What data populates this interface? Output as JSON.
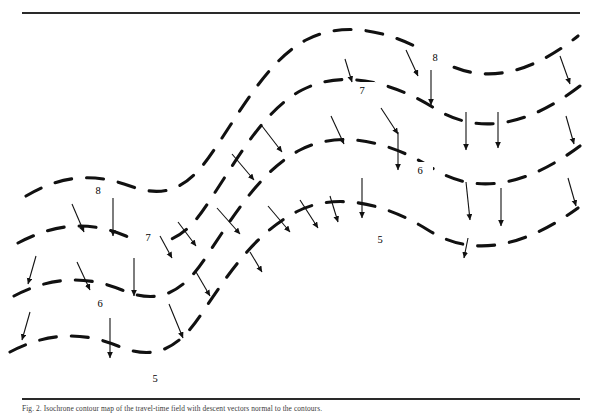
{
  "figure": {
    "kind": "contour-map",
    "background": "#ffffff",
    "ink_color": "#111111",
    "rule_color": "#2a2a2a",
    "top_rule": true,
    "bottom_rule": true
  },
  "caption": {
    "text": "Fig. 2. Isochrone contour map of the travel-time field with descent vectors normal to the contours."
  },
  "chart_data": {
    "type": "contour",
    "title": "",
    "xlabel": "",
    "ylabel": "",
    "grid": false,
    "legend": false,
    "line_style": "dashed",
    "line_color": "#111111",
    "levels": [
      8,
      7,
      6,
      5
    ],
    "level_label_text": [
      "8",
      "7",
      "6",
      "5"
    ],
    "arrows_meaning": "gradient-descent direction normal to contours",
    "arrow_count": 33,
    "contours": [
      {
        "level": 8,
        "label": "8",
        "labels_at": [
          [
            98,
            190
          ],
          [
            435,
            57
          ]
        ],
        "path": "M 26,196 C 60,176 92,172 130,186 C 168,200 190,186 214,150 C 240,112 268,60 306,40 C 348,18 398,34 436,58 C 474,82 520,82 578,36"
      },
      {
        "level": 7,
        "label": "7",
        "labels_at": [
          [
            148,
            237
          ],
          [
            362,
            90
          ]
        ],
        "path": "M 18,243 C 54,224 88,220 126,236 C 164,252 186,238 210,200 C 238,158 264,110 302,90 C 344,68 396,84 434,108 C 472,132 520,132 580,86"
      },
      {
        "level": 6,
        "label": "6",
        "labels_at": [
          [
            100,
            303
          ],
          [
            420,
            170
          ]
        ],
        "path": "M 14,296 C 48,278 84,274 122,290 C 160,306 184,292 208,254 C 236,212 262,170 300,150 C 342,128 394,144 432,168 C 470,192 518,192 580,146"
      },
      {
        "level": 5,
        "label": "5",
        "labels_at": [
          [
            155,
            378
          ],
          [
            380,
            239
          ]
        ],
        "path": "M 10,352 C 44,334 80,330 118,346 C 156,362 180,348 204,310 C 232,268 258,232 296,212 C 338,190 390,206 428,230 C 466,254 514,254 578,208"
      }
    ],
    "arrows": [
      {
        "x1": 72,
        "y1": 204,
        "x2": 84,
        "y2": 232
      },
      {
        "x1": 113,
        "y1": 198,
        "x2": 113,
        "y2": 236
      },
      {
        "x1": 36,
        "y1": 256,
        "x2": 28,
        "y2": 284
      },
      {
        "x1": 77,
        "y1": 262,
        "x2": 90,
        "y2": 290
      },
      {
        "x1": 134,
        "y1": 258,
        "x2": 134,
        "y2": 296
      },
      {
        "x1": 30,
        "y1": 312,
        "x2": 22,
        "y2": 340
      },
      {
        "x1": 110,
        "y1": 318,
        "x2": 110,
        "y2": 358
      },
      {
        "x1": 169,
        "y1": 304,
        "x2": 183,
        "y2": 338
      },
      {
        "x1": 178,
        "y1": 222,
        "x2": 196,
        "y2": 246
      },
      {
        "x1": 217,
        "y1": 208,
        "x2": 240,
        "y2": 234
      },
      {
        "x1": 232,
        "y1": 154,
        "x2": 254,
        "y2": 180
      },
      {
        "x1": 262,
        "y1": 126,
        "x2": 282,
        "y2": 152
      },
      {
        "x1": 268,
        "y1": 206,
        "x2": 290,
        "y2": 232
      },
      {
        "x1": 300,
        "y1": 200,
        "x2": 318,
        "y2": 228
      },
      {
        "x1": 331,
        "y1": 116,
        "x2": 344,
        "y2": 144
      },
      {
        "x1": 345,
        "y1": 59,
        "x2": 352,
        "y2": 82
      },
      {
        "x1": 362,
        "y1": 178,
        "x2": 362,
        "y2": 218
      },
      {
        "x1": 381,
        "y1": 108,
        "x2": 398,
        "y2": 134
      },
      {
        "x1": 398,
        "y1": 132,
        "x2": 398,
        "y2": 170
      },
      {
        "x1": 406,
        "y1": 50,
        "x2": 418,
        "y2": 76
      },
      {
        "x1": 431,
        "y1": 70,
        "x2": 431,
        "y2": 105
      },
      {
        "x1": 466,
        "y1": 112,
        "x2": 466,
        "y2": 150
      },
      {
        "x1": 466,
        "y1": 182,
        "x2": 470,
        "y2": 220
      },
      {
        "x1": 498,
        "y1": 112,
        "x2": 498,
        "y2": 148
      },
      {
        "x1": 501,
        "y1": 188,
        "x2": 501,
        "y2": 226
      },
      {
        "x1": 468,
        "y1": 238,
        "x2": 464,
        "y2": 258
      },
      {
        "x1": 560,
        "y1": 56,
        "x2": 570,
        "y2": 84
      },
      {
        "x1": 566,
        "y1": 116,
        "x2": 574,
        "y2": 144
      },
      {
        "x1": 568,
        "y1": 178,
        "x2": 576,
        "y2": 206
      },
      {
        "x1": 160,
        "y1": 236,
        "x2": 172,
        "y2": 258
      },
      {
        "x1": 196,
        "y1": 272,
        "x2": 210,
        "y2": 296
      },
      {
        "x1": 250,
        "y1": 252,
        "x2": 262,
        "y2": 272
      },
      {
        "x1": 330,
        "y1": 196,
        "x2": 338,
        "y2": 222
      }
    ]
  }
}
